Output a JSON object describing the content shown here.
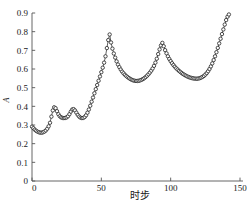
{
  "chart_data": {
    "type": "line",
    "title": "",
    "subtitle": "",
    "xlabel": "时步",
    "ylabel": "A",
    "xlim": [
      0,
      150
    ],
    "ylim": [
      0,
      0.9
    ],
    "grid": false,
    "legend": null,
    "marker": "open-circle",
    "xticks": [
      0,
      50,
      100,
      150
    ],
    "xtick_labels": [
      "0",
      "50",
      "100",
      "150"
    ],
    "yticks": [
      0,
      0.1,
      0.2,
      0.3,
      0.4,
      0.5,
      0.6,
      0.7,
      0.8,
      0.9
    ],
    "ytick_labels": [
      "0",
      "0.1",
      "0.2",
      "0.3",
      "0.4",
      "0.5",
      "0.6",
      "0.7",
      "0.8",
      "0.9"
    ],
    "series": [
      {
        "name": "A",
        "x": [
          0,
          1,
          2,
          3,
          4,
          5,
          6,
          7,
          8,
          9,
          10,
          11,
          12,
          13,
          14,
          15,
          16,
          17,
          18,
          19,
          20,
          21,
          22,
          23,
          24,
          25,
          26,
          27,
          28,
          29,
          30,
          31,
          32,
          33,
          34,
          35,
          36,
          37,
          38,
          39,
          40,
          41,
          42,
          43,
          44,
          45,
          46,
          47,
          48,
          49,
          50,
          51,
          52,
          53,
          54,
          55,
          56,
          57,
          58,
          59,
          60,
          61,
          62,
          63,
          64,
          65,
          66,
          67,
          68,
          69,
          70,
          71,
          72,
          73,
          74,
          75,
          76,
          77,
          78,
          79,
          80,
          81,
          82,
          83,
          84,
          85,
          86,
          87,
          88,
          89,
          90,
          91,
          92,
          93,
          94,
          95,
          96,
          97,
          98,
          99,
          100,
          101,
          102,
          103,
          104,
          105,
          106,
          107,
          108,
          109,
          110,
          111,
          112,
          113,
          114,
          115,
          116,
          117,
          118,
          119,
          120,
          121,
          122,
          123,
          124,
          125,
          126,
          127,
          128,
          129,
          130,
          131,
          132,
          133,
          134,
          135,
          136,
          137,
          138,
          139,
          140,
          141,
          142
        ],
        "y": [
          0.291,
          0.283,
          0.275,
          0.269,
          0.264,
          0.261,
          0.259,
          0.259,
          0.261,
          0.265,
          0.271,
          0.28,
          0.293,
          0.312,
          0.345,
          0.378,
          0.395,
          0.39,
          0.374,
          0.358,
          0.347,
          0.341,
          0.338,
          0.337,
          0.338,
          0.341,
          0.347,
          0.358,
          0.372,
          0.383,
          0.385,
          0.378,
          0.366,
          0.354,
          0.345,
          0.339,
          0.337,
          0.338,
          0.343,
          0.352,
          0.366,
          0.383,
          0.403,
          0.425,
          0.447,
          0.47,
          0.492,
          0.514,
          0.537,
          0.56,
          0.583,
          0.607,
          0.634,
          0.668,
          0.712,
          0.755,
          0.785,
          0.742,
          0.709,
          0.683,
          0.661,
          0.641,
          0.624,
          0.61,
          0.597,
          0.586,
          0.577,
          0.569,
          0.562,
          0.556,
          0.551,
          0.546,
          0.542,
          0.539,
          0.537,
          0.536,
          0.536,
          0.537,
          0.539,
          0.542,
          0.546,
          0.551,
          0.557,
          0.564,
          0.572,
          0.581,
          0.591,
          0.603,
          0.617,
          0.634,
          0.655,
          0.68,
          0.705,
          0.726,
          0.74,
          0.722,
          0.701,
          0.684,
          0.668,
          0.654,
          0.642,
          0.631,
          0.621,
          0.612,
          0.604,
          0.597,
          0.59,
          0.584,
          0.578,
          0.573,
          0.568,
          0.564,
          0.56,
          0.557,
          0.554,
          0.552,
          0.55,
          0.549,
          0.548,
          0.548,
          0.549,
          0.551,
          0.554,
          0.558,
          0.563,
          0.57,
          0.578,
          0.588,
          0.6,
          0.614,
          0.63,
          0.648,
          0.668,
          0.69,
          0.713,
          0.737,
          0.762,
          0.787,
          0.812,
          0.838,
          0.862,
          0.88,
          0.892
        ]
      }
    ],
    "annotations": [
      {
        "label": "peak-1",
        "x": 16,
        "y": 0.395
      },
      {
        "label": "peak-2",
        "x": 30,
        "y": 0.385
      },
      {
        "label": "peak-3",
        "x": 56,
        "y": 0.785
      },
      {
        "label": "peak-4",
        "x": 94,
        "y": 0.74
      },
      {
        "label": "trough-1",
        "x": 7,
        "y": 0.259
      },
      {
        "label": "trough-2",
        "x": 23,
        "y": 0.337
      },
      {
        "label": "trough-3",
        "x": 36,
        "y": 0.337
      },
      {
        "label": "trough-4",
        "x": 75,
        "y": 0.536
      },
      {
        "label": "trough-5",
        "x": 119,
        "y": 0.548
      },
      {
        "label": "end",
        "x": 142,
        "y": 0.892
      }
    ]
  },
  "colors": {
    "axis": "#555555",
    "marker_stroke": "#2b2b2b",
    "marker_fill": "#ffffff",
    "line": "#3a3a3a",
    "text": "#1a1a1a",
    "background": "#ffffff"
  }
}
